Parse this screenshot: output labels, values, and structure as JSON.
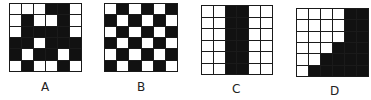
{
  "figures": [
    {
      "label": "A",
      "rows": 6,
      "cols": 6,
      "cells": [
        [
          0,
          0,
          0,
          1,
          1,
          0
        ],
        [
          0,
          1,
          0,
          0,
          1,
          0
        ],
        [
          0,
          1,
          1,
          1,
          1,
          0
        ],
        [
          1,
          1,
          0,
          1,
          1,
          1
        ],
        [
          1,
          0,
          1,
          1,
          0,
          1
        ],
        [
          0,
          1,
          0,
          0,
          1,
          0
        ]
      ]
    },
    {
      "label": "B",
      "rows": 6,
      "cols": 6,
      "cells": [
        [
          0,
          1,
          0,
          1,
          0,
          1
        ],
        [
          1,
          0,
          1,
          0,
          1,
          0
        ],
        [
          0,
          1,
          0,
          1,
          0,
          1
        ],
        [
          1,
          0,
          1,
          0,
          1,
          0
        ],
        [
          0,
          1,
          0,
          1,
          0,
          1
        ],
        [
          1,
          0,
          1,
          0,
          1,
          0
        ]
      ]
    },
    {
      "label": "C",
      "rows": 6,
      "cols": 6,
      "cells": [
        [
          0,
          0,
          1,
          1,
          0,
          0
        ],
        [
          0,
          0,
          1,
          1,
          0,
          0
        ],
        [
          0,
          0,
          1,
          1,
          0,
          0
        ],
        [
          0,
          0,
          1,
          1,
          0,
          0
        ],
        [
          0,
          0,
          1,
          1,
          0,
          0
        ],
        [
          0,
          0,
          1,
          1,
          0,
          0
        ]
      ]
    },
    {
      "label": "D",
      "rows": 6,
      "cols": 6,
      "cells": [
        [
          0,
          0,
          0,
          0,
          1,
          1
        ],
        [
          0,
          0,
          0,
          0,
          1,
          1
        ],
        [
          0,
          0,
          0,
          0,
          1,
          1
        ],
        [
          0,
          0,
          0,
          1,
          1,
          1
        ],
        [
          0,
          0,
          1,
          1,
          1,
          1
        ],
        [
          0,
          1,
          1,
          1,
          1,
          1
        ]
      ]
    }
  ],
  "colors": {
    "black": "#111111",
    "white": "#ffffff",
    "grid_line": "#1a1a1a"
  }
}
